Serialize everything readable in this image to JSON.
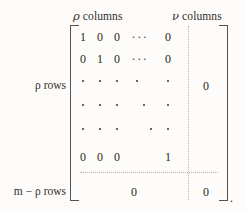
{
  "headers": {
    "left_columns": {
      "symbol": "ρ",
      "text": "columns"
    },
    "right_columns": {
      "symbol": "ν",
      "text": "columns"
    }
  },
  "row_labels": {
    "identity_block": "ρ rows",
    "zero_block": "m − ρ rows"
  },
  "matrix": {
    "rows": [
      {
        "cells": [
          "1",
          "0",
          "0"
        ],
        "ellipsis": "···",
        "last": "0"
      },
      {
        "cells": [
          "0",
          "1",
          "0"
        ],
        "ellipsis": "···",
        "last": "0"
      },
      {
        "cells": [
          "0",
          "0",
          "0"
        ],
        "ellipsis": "",
        "last": "1"
      }
    ],
    "right_zero_upper": "0",
    "bottom_zero_left": "0",
    "bottom_zero_right": "0"
  },
  "punctuation": {
    "trailing_period": "."
  },
  "colors": {
    "background": "#fdfcfa",
    "ink": "#2a2724",
    "bracket": "#56524e",
    "divider": "#b9b4ae"
  }
}
